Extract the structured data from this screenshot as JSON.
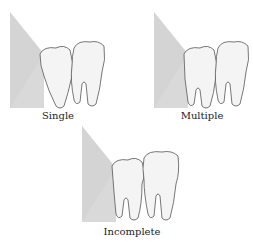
{
  "figure": {
    "panels": [
      {
        "id": "single",
        "label": "Single"
      },
      {
        "id": "multiple",
        "label": "Multiple"
      },
      {
        "id": "incomplete",
        "label": "Incomplete"
      }
    ]
  },
  "colors": {
    "background": "#ffffff",
    "gum_shade": "#d9d9d9",
    "tooth": "#f4f4f4",
    "tooth_outline": "#555555",
    "label": "#222222"
  }
}
